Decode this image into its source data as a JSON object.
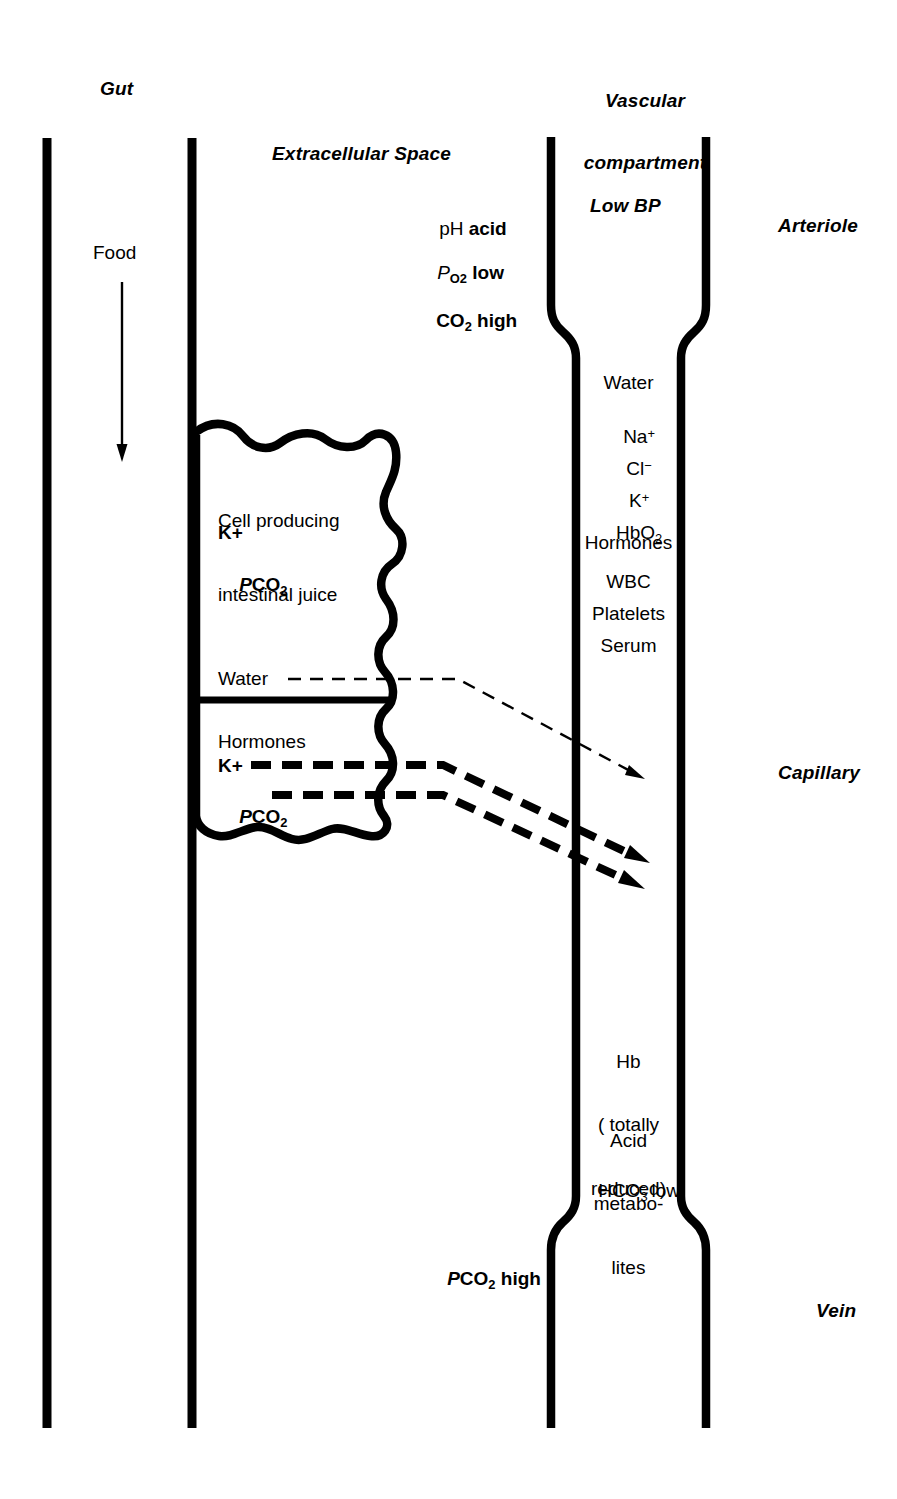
{
  "figure": {
    "type": "physiological-schematic"
  },
  "headings": {
    "gut": "Gut",
    "vascular_compartment_line1": "Vascular",
    "vascular_compartment_line2": "compartment",
    "extracellular_space": "Extracellular Space"
  },
  "gut": {
    "food_label": "Food",
    "flow_arrow": "down-arrow"
  },
  "extracellular_space": {
    "conditions": [
      {
        "symbol": "pH",
        "symbol_style": "plain",
        "value": "acid"
      },
      {
        "symbol": "P",
        "sub": "O",
        "sub2": "2",
        "symbol_style": "italic-P",
        "value": "low"
      },
      {
        "symbol": "CO",
        "sub": "2",
        "symbol_style": "bold",
        "value": "high"
      }
    ],
    "ph_symbol": "pH",
    "ph_value": "acid",
    "po2_p": "P",
    "po2_sub": "O",
    "po2_sub_num": "2",
    "po2_value": "low",
    "co2_main": "CO",
    "co2_sub": "2",
    "co2_value": "high",
    "bottom_pco2_p": "P",
    "bottom_pco2_sub": "CO",
    "bottom_pco2_subnum": "2",
    "bottom_pco2_value": "high"
  },
  "cell": {
    "title_line1": "Cell producing",
    "title_line2": "intestinal juice",
    "contents_k": "K+",
    "contents_pco2_p": "P",
    "contents_pco2_sub": "CO",
    "contents_pco2_subnum": "2",
    "secretion_water": "Water",
    "secretion_hormones": "Hormones",
    "secretion_k": "K+",
    "secretion_pco2_p": "P",
    "secretion_pco2_sub": "CO",
    "secretion_pco2_subnum": "2"
  },
  "vessel": {
    "low_bp": "Low BP",
    "arteriole_label": "Arteriole",
    "capillary_label": "Capillary",
    "vein_label": "Vein",
    "arterial_contents": [
      "Water",
      "Na+",
      "Cl-",
      "K+",
      "HbO2",
      "Hormones",
      "WBC",
      "Platelets",
      "Serum"
    ],
    "arterial_water": "Water",
    "arterial_na_main": "Na",
    "arterial_na_sup": "+",
    "arterial_cl_main": "Cl",
    "arterial_cl_sup": "−",
    "arterial_k_main": "K",
    "arterial_k_sup": "+",
    "arterial_hb_main": "HbO",
    "arterial_hb_sub": "2",
    "arterial_hormones": "Hormones",
    "arterial_wbc": "WBC",
    "arterial_platelets": "Platelets",
    "arterial_serum": "Serum",
    "venous_hb_line1": "Hb",
    "venous_hb_line2": "( totally",
    "venous_hb_line3": "reduced)",
    "venous_acid_line1": "Acid",
    "venous_acid_line2": "metabo-",
    "venous_acid_line3": "lites",
    "venous_hco3_main": "HCO",
    "venous_hco3_sub": "3",
    "venous_hco3_sup": "−",
    "venous_hco3_value": "low"
  },
  "colors": {
    "ink": "#000000",
    "background": "#ffffff"
  }
}
